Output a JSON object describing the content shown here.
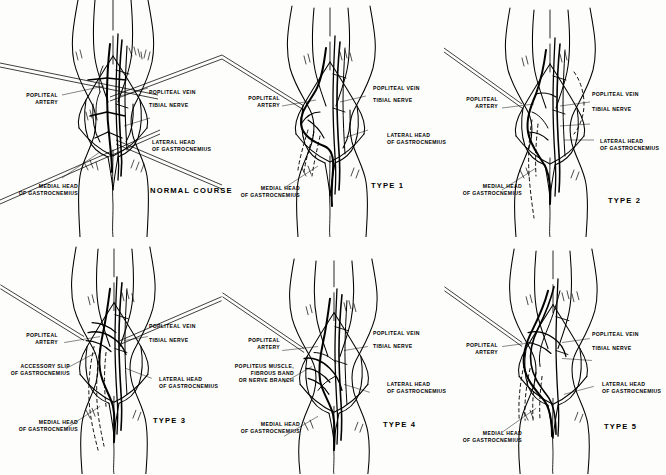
{
  "figure": {
    "background": "#fdfdfb",
    "ink": "#000000",
    "rows": 2,
    "cols": 3
  },
  "labels": {
    "popliteal_artery": "POPLITEAL\nARTERY",
    "popliteal_artery_l1": "POPLITEAL",
    "popliteal_artery_l2": "ARTERY",
    "popliteal_vein": "POPLITEAL VEIN",
    "tibial_nerve": "TIBIAL NERVE",
    "lateral_head_l1": "LATERAL HEAD",
    "lateral_head_l2": "OF GASTROCNEMIUS",
    "medial_head_l1": "MEDIAL HEAD",
    "medial_head_l2": "OF GASTROCNEMIUS",
    "accessory_slip_l1": "ACCESSORY SLIP",
    "accessory_slip_l2": "OF GASTROCNEMIUS",
    "popliteus_l1": "POPLITEUS MUSCLE,",
    "popliteus_l2": "FIBROUS BAND",
    "popliteus_l3": "OR NERVE BRANCH"
  },
  "panels": [
    {
      "id": "panel-normal-course",
      "index": 0,
      "title": "NORMAL COURSE",
      "row": 0,
      "col": 0,
      "has_accessory_slip": false,
      "has_popliteus_band": false
    },
    {
      "id": "panel-type-1",
      "index": 1,
      "title": "TYPE 1",
      "row": 0,
      "col": 1,
      "has_accessory_slip": false,
      "has_popliteus_band": false
    },
    {
      "id": "panel-type-2",
      "index": 2,
      "title": "TYPE 2",
      "row": 0,
      "col": 2,
      "has_accessory_slip": false,
      "has_popliteus_band": false
    },
    {
      "id": "panel-type-3",
      "index": 3,
      "title": "TYPE 3",
      "row": 1,
      "col": 0,
      "has_accessory_slip": true,
      "has_popliteus_band": false
    },
    {
      "id": "panel-type-4",
      "index": 4,
      "title": "TYPE 4",
      "row": 1,
      "col": 1,
      "has_accessory_slip": false,
      "has_popliteus_band": true
    },
    {
      "id": "panel-type-5",
      "index": 5,
      "title": "TYPE 5",
      "row": 1,
      "col": 2,
      "has_accessory_slip": false,
      "has_popliteus_band": false
    }
  ]
}
